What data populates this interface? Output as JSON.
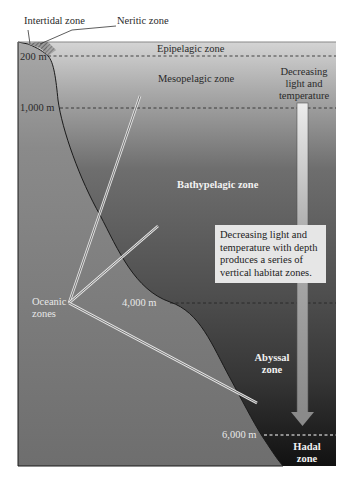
{
  "diagram": {
    "callouts": {
      "intertidal": "Intertidal zone",
      "neritic": "Neritic zone"
    },
    "zones": {
      "epipelagic": "Epipelagic zone",
      "mesopelagic": "Mesopelagic zone",
      "bathypelagic": "Bathypelagic zone",
      "abyssal_line1": "Abyssal",
      "abyssal_line2": "zone",
      "hadal_line1": "Hadal",
      "hadal_line2": "zone"
    },
    "depths": {
      "d200": "200 m",
      "d1000": "1,000 m",
      "d4000": "4,000 m",
      "d6000": "6,000 m"
    },
    "oceanic": {
      "line1": "Oceanic",
      "line2": "zones"
    },
    "arrow_label": {
      "line1": "Decreasing",
      "line2": "light and",
      "line3": "temperature"
    },
    "note": "Decreasing light and temperature with depth produces a series of vertical habitat zones.",
    "colors": {
      "surface": "#d4d4d4",
      "deep": "#1a1a1a",
      "seafloor": "#7a7a7a",
      "arrow": "#9a9a9a"
    }
  }
}
